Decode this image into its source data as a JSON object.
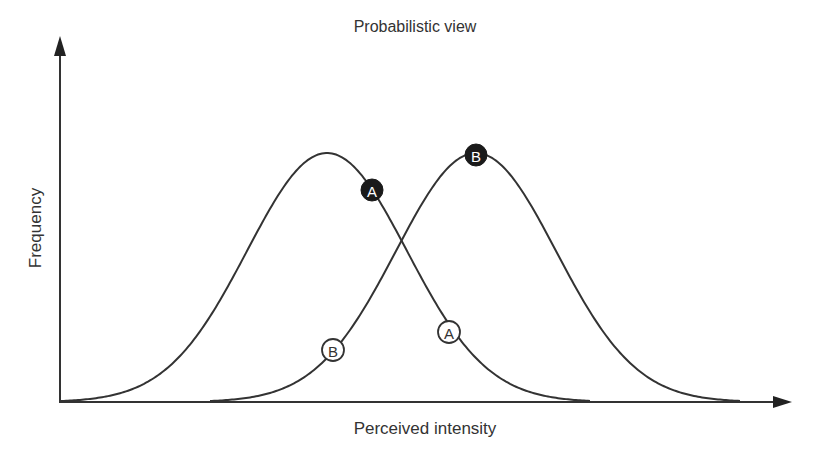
{
  "chart_data": {
    "type": "line",
    "title": "Probabilistic view",
    "xlabel": "Perceived intensity",
    "ylabel": "Frequency",
    "grid": false,
    "legend": null,
    "axis_ticks": "none",
    "series": [
      {
        "name": "A",
        "shape": "gaussian",
        "peak_x_px": 327,
        "peak_y_px": 153,
        "sigma_px": 80,
        "range_px": [
          60,
          590
        ]
      },
      {
        "name": "B",
        "shape": "gaussian",
        "peak_x_px": 476,
        "peak_y_px": 153,
        "sigma_px": 80,
        "range_px": [
          210,
          740
        ]
      }
    ],
    "annotations": [
      {
        "label": "A",
        "style": "filled",
        "x_px": 372,
        "y_px": 190
      },
      {
        "label": "B",
        "style": "filled",
        "x_px": 476,
        "y_px": 155
      },
      {
        "label": "B",
        "style": "open",
        "x_px": 333,
        "y_px": 350
      },
      {
        "label": "A",
        "style": "open",
        "x_px": 449,
        "y_px": 332
      }
    ],
    "colors": {
      "line": "#333333",
      "filled_marker": "#1a1a1a",
      "open_marker_fill": "#ffffff",
      "axis": "#333333"
    }
  },
  "labels": {
    "title": "Probabilistic view",
    "xlabel": "Perceived intensity",
    "ylabel": "Frequency",
    "markers": [
      "A",
      "B",
      "B",
      "A"
    ]
  }
}
